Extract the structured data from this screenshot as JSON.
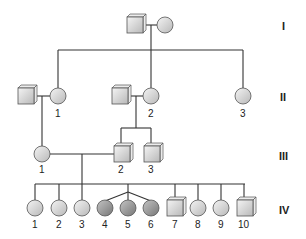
{
  "colors": {
    "line": "#333333",
    "unaffected_fill_light": "#f2f2f2",
    "unaffected_fill_dark": "#bdbdbd",
    "affected_fill_light": "#bfbfbf",
    "affected_fill_dark": "#7a7a7a",
    "outline": "#555555"
  },
  "generations": [
    {
      "label": "I",
      "individuals": [
        {
          "id": "I-m",
          "sex": "male",
          "number": "",
          "affected": false
        },
        {
          "id": "I-f",
          "sex": "female",
          "number": "",
          "affected": false
        }
      ]
    },
    {
      "label": "II",
      "individuals": [
        {
          "id": "II-spouse-a",
          "sex": "male",
          "number": "",
          "affected": false
        },
        {
          "id": "II-1",
          "sex": "female",
          "number": "1",
          "affected": false
        },
        {
          "id": "II-spouse-b",
          "sex": "male",
          "number": "",
          "affected": false
        },
        {
          "id": "II-2",
          "sex": "female",
          "number": "2",
          "affected": false
        },
        {
          "id": "II-3",
          "sex": "female",
          "number": "3",
          "affected": false
        }
      ]
    },
    {
      "label": "III",
      "individuals": [
        {
          "id": "III-1",
          "sex": "female",
          "number": "1",
          "affected": false
        },
        {
          "id": "III-2",
          "sex": "male",
          "number": "2",
          "affected": false
        },
        {
          "id": "III-3",
          "sex": "male",
          "number": "3",
          "affected": false
        }
      ]
    },
    {
      "label": "IV",
      "individuals": [
        {
          "id": "IV-1",
          "sex": "female",
          "number": "1",
          "affected": false
        },
        {
          "id": "IV-2",
          "sex": "female",
          "number": "2",
          "affected": false
        },
        {
          "id": "IV-3",
          "sex": "female",
          "number": "3",
          "affected": false
        },
        {
          "id": "IV-4",
          "sex": "female",
          "number": "4",
          "affected": true,
          "note": "triplet"
        },
        {
          "id": "IV-5",
          "sex": "female",
          "number": "5",
          "affected": true,
          "note": "triplet"
        },
        {
          "id": "IV-6",
          "sex": "female",
          "number": "6",
          "affected": true,
          "note": "triplet"
        },
        {
          "id": "IV-7",
          "sex": "male",
          "number": "7",
          "affected": false
        },
        {
          "id": "IV-8",
          "sex": "female",
          "number": "8",
          "affected": false
        },
        {
          "id": "IV-9",
          "sex": "female",
          "number": "9",
          "affected": false
        },
        {
          "id": "IV-10",
          "sex": "male",
          "number": "10",
          "affected": false
        }
      ]
    }
  ],
  "labels": {
    "gen_I": "I",
    "gen_II": "II",
    "gen_III": "III",
    "gen_IV": "IV",
    "II_1": "1",
    "II_2": "2",
    "II_3": "3",
    "III_1": "1",
    "III_2": "2",
    "III_3": "3",
    "IV_1": "1",
    "IV_2": "2",
    "IV_3": "3",
    "IV_4": "4",
    "IV_5": "5",
    "IV_6": "6",
    "IV_7": "7",
    "IV_8": "8",
    "IV_9": "9",
    "IV_10": "10"
  }
}
